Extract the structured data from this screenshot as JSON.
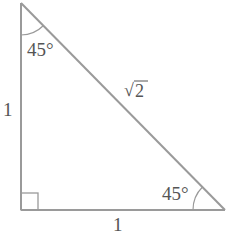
{
  "diagram": {
    "type": "right-isosceles-triangle",
    "colors": {
      "line": "#9a9a9a",
      "text": "#555555",
      "background": "#ffffff"
    },
    "vertices": {
      "top": [
        21,
        3
      ],
      "bottom_left": [
        21,
        210
      ],
      "bottom_right": [
        225,
        210
      ]
    },
    "labels": {
      "top_angle": "45°",
      "right_angle": "45°",
      "left_side": "1",
      "bottom_side": "1",
      "hypotenuse_radicand": "2",
      "hypotenuse_radical": "√"
    },
    "right_angle_marker": "square"
  }
}
